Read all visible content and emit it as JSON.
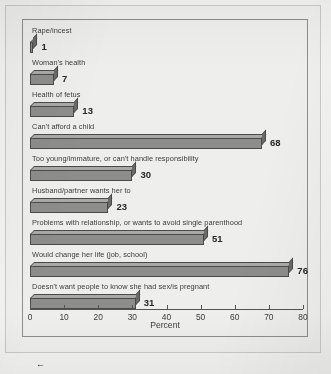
{
  "chart_data": {
    "type": "bar",
    "orientation": "horizontal",
    "title": "",
    "xlabel": "Percent",
    "ylabel": "",
    "xlim": [
      0,
      80
    ],
    "xticks": [
      0,
      10,
      20,
      30,
      40,
      50,
      60,
      70,
      80
    ],
    "grid": false,
    "legend": null,
    "categories": [
      "Rape/incest",
      "Woman's health",
      "Health of fetus",
      "Can't afford a child",
      "Too young/immature, or can't handle responsibility",
      "Husband/partner wants her to",
      "Problems with relationship, or wants to avoid single parenthood",
      "Would change her life (job, school)",
      "Doesn't want people to know she had sex/is pregnant"
    ],
    "values": [
      1,
      7,
      13,
      68,
      30,
      23,
      51,
      76,
      31
    ],
    "value_labels": [
      "1",
      "7",
      "13",
      "68",
      "30",
      "23",
      "51",
      "76",
      "31"
    ],
    "bar_style": "3d-block",
    "colors": {
      "bar_front": "#8d8d8b",
      "bar_top": "#a9a9a7",
      "bar_side": "#6a6a68",
      "bar_outline": "#4a4a48",
      "plot_background": "#eeeeec",
      "page_background": "#f3f3f1",
      "frame": "#8e8e8c",
      "text": "#3a3a38"
    }
  },
  "artifacts": {
    "scan_arrow": "←"
  }
}
